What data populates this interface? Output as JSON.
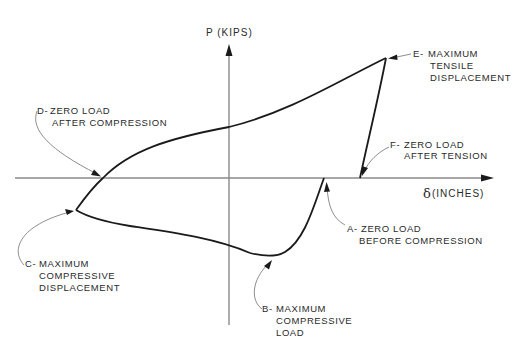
{
  "diagram": {
    "type": "hysteresis-loop",
    "axes": {
      "y_label": "P (KIPS)",
      "x_label_symbol": "δ",
      "x_label_units": "(INCHES)"
    },
    "points": [
      {
        "id": "A",
        "prefix": "A-",
        "lines": [
          "ZERO LOAD",
          "BEFORE COMPRESSION"
        ]
      },
      {
        "id": "B",
        "prefix": "B-",
        "lines": [
          "MAXIMUM",
          "COMPRESSIVE",
          "LOAD"
        ]
      },
      {
        "id": "C",
        "prefix": "C-",
        "lines": [
          "MAXIMUM",
          "COMPRESSIVE",
          "DISPLACEMENT"
        ]
      },
      {
        "id": "D",
        "prefix": "D-",
        "lines": [
          "ZERO LOAD",
          "AFTER COMPRESSION"
        ]
      },
      {
        "id": "E",
        "prefix": "E-",
        "lines": [
          "MAXIMUM",
          "TENSILE",
          "DISPLACEMENT"
        ]
      },
      {
        "id": "F",
        "prefix": "F-",
        "lines": [
          "ZERO LOAD",
          "AFTER TENSION"
        ]
      }
    ],
    "path_order": [
      "A",
      "B",
      "C",
      "D",
      "E",
      "F"
    ]
  }
}
